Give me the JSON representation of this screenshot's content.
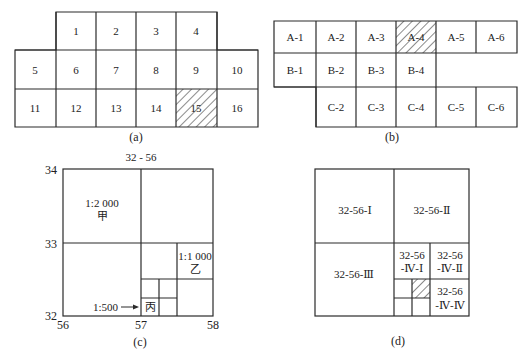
{
  "colors": {
    "line": "#2a2a2a",
    "text": "#222222",
    "background": "#ffffff"
  },
  "panels": {
    "a": {
      "caption": "(a)",
      "rows": [
        [
          "",
          "1",
          "2",
          "3",
          "4",
          ""
        ],
        [
          "5",
          "6",
          "7",
          "8",
          "9",
          "10"
        ],
        [
          "11",
          "12",
          "13",
          "14",
          "15",
          "16"
        ]
      ],
      "hatched_cell": "15"
    },
    "b": {
      "caption": "(b)",
      "rows": [
        [
          "A-1",
          "A-2",
          "A-3",
          "A-4",
          "A-5",
          "A-6"
        ],
        [
          "B-1",
          "B-2",
          "B-3",
          "B-4",
          "",
          ""
        ],
        [
          "",
          "C-2",
          "C-3",
          "C-4",
          "C-5",
          "C-6"
        ]
      ],
      "hatched_cell": "A-4"
    },
    "c": {
      "caption": "(c)",
      "sheet_label": "32 - 56",
      "y_ticks": [
        "34",
        "33",
        "32"
      ],
      "x_ticks": [
        "56",
        "57",
        "58"
      ],
      "scale_2000": "1:2 000",
      "label_jia": "甲",
      "scale_1000": "1:1 000",
      "label_yi": "乙",
      "scale_500": "1:500",
      "label_bing": "丙"
    },
    "d": {
      "caption": "(d)",
      "q1": "32-56-Ⅰ",
      "q2": "32-56-Ⅱ",
      "q3": "32-56-Ⅲ",
      "q4_1_line1": "32-56",
      "q4_1_line2": "-Ⅳ-Ⅰ",
      "q4_2_line1": "32-56",
      "q4_2_line2": "-Ⅳ-Ⅱ",
      "q4_4_line1": "32-56",
      "q4_4_line2": "-Ⅳ-Ⅳ"
    }
  }
}
